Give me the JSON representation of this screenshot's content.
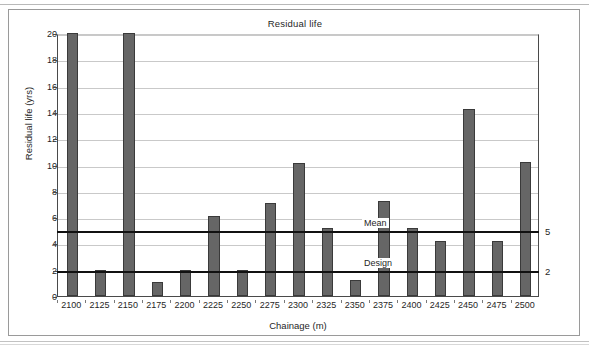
{
  "figure": {
    "title": "Residual life",
    "x_axis_title": "Chainage (m)",
    "y_axis_title": "Residual life (yrs)"
  },
  "annotations": {
    "mean_label": "Mean",
    "design_label": "Design",
    "mean_right_value": "5",
    "design_right_value": "2"
  },
  "chart_data": {
    "type": "bar",
    "title": "Residual life",
    "xlabel": "Chainage (m)",
    "ylabel": "Residual life (yrs)",
    "ylim": [
      0,
      20
    ],
    "ytick_labels": [
      "0",
      "2",
      "4",
      "6",
      "8",
      "10",
      "12",
      "14",
      "16",
      "18",
      "20"
    ],
    "ytick_values": [
      0,
      2,
      4,
      6,
      8,
      10,
      12,
      14,
      16,
      18,
      20
    ],
    "grid": true,
    "legend": "none",
    "bar_color": "#666666",
    "categories": [
      "2100",
      "2125",
      "2150",
      "2175",
      "2200",
      "2225",
      "2250",
      "2275",
      "2300",
      "2325",
      "2350",
      "2375",
      "2400",
      "2425",
      "2450",
      "2475",
      "2500"
    ],
    "values": [
      20,
      2,
      20,
      1.1,
      2,
      6.1,
      2,
      7.1,
      10.1,
      5.2,
      1.2,
      7.2,
      5.2,
      4.2,
      14.2,
      4.2,
      10.2
    ],
    "reference_lines": [
      {
        "name": "Mean",
        "value": 5,
        "label": "Mean",
        "right_axis_label": "5",
        "color": "#111111"
      },
      {
        "name": "Design",
        "value": 2,
        "label": "Design",
        "right_axis_label": "2",
        "color": "#111111"
      }
    ]
  }
}
